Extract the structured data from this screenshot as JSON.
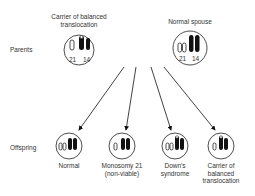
{
  "row_labels": {
    "parents": "Parents",
    "offspring": "Offspring"
  },
  "parents": [
    {
      "title_l1": "Carrier of balanced",
      "title_l2": "translocation",
      "chrom_labels": [
        "21",
        "14"
      ]
    },
    {
      "title_l1": "Normal spouse",
      "title_l2": "",
      "chrom_labels": [
        "21",
        "14"
      ]
    }
  ],
  "offspring": [
    {
      "l1": "Normal",
      "l2": "",
      "l3": ""
    },
    {
      "l1": "Monosomy 21",
      "l2": "(non-viable)",
      "l3": ""
    },
    {
      "l1": "Down's",
      "l2": "syndrome",
      "l3": ""
    },
    {
      "l1": "Carrier of",
      "l2": "balanced",
      "l3": "translocation"
    }
  ]
}
